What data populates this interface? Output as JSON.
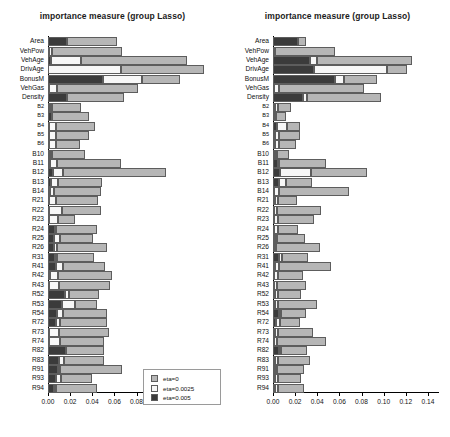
{
  "figure": {
    "width": 450,
    "height": 437,
    "background": "#ffffff"
  },
  "legend": {
    "entries": [
      {
        "label": "eta=0",
        "color": "#b6b6b6",
        "key": "e0"
      },
      {
        "label": "eta=0.0025",
        "color": "#f7f7f7",
        "key": "e1"
      },
      {
        "label": "eta=0.005",
        "color": "#3b3b3b",
        "key": "e2"
      }
    ]
  },
  "axis": {
    "ticks": [
      0,
      0.02,
      0.04,
      0.06,
      0.08,
      0.1,
      0.12,
      0.14
    ],
    "tick_labels": [
      "0.00",
      "0.02",
      "0.04",
      "0.06",
      "0.08",
      "0.10",
      "0.12",
      "0.14"
    ],
    "xlim": [
      0,
      0.15
    ]
  },
  "categories": [
    "Area",
    "VehPow",
    "VehAge",
    "DrivAge",
    "BonusM",
    "VehGas",
    "Density",
    "B2",
    "B3",
    "B4",
    "B5",
    "B6",
    "B10",
    "B11",
    "B12",
    "B13",
    "B14",
    "R21",
    "R22",
    "R23",
    "R24",
    "R25",
    "R26",
    "R31",
    "R41",
    "R42",
    "R43",
    "R52",
    "R53",
    "R54",
    "R72",
    "R73",
    "R74",
    "R82",
    "R83",
    "R91",
    "R93",
    "R94"
  ],
  "small_labels": [
    "B2",
    "B3",
    "B4",
    "B5",
    "B6"
  ],
  "chart_data": [
    {
      "type": "bar",
      "orientation": "horizontal",
      "stacked": true,
      "panel": "left",
      "title": "importance measure (group Lasso)",
      "xlabel": "",
      "ylabel": "",
      "xlim": [
        0,
        0.15
      ],
      "grid": false,
      "legend_position": "bottom-right",
      "categories": [
        "Area",
        "VehPow",
        "VehAge",
        "DrivAge",
        "BonusM",
        "VehGas",
        "Density",
        "B2",
        "B3",
        "B4",
        "B5",
        "B6",
        "B10",
        "B11",
        "B12",
        "B13",
        "B14",
        "R21",
        "R22",
        "R23",
        "R24",
        "R25",
        "R26",
        "R31",
        "R41",
        "R42",
        "R43",
        "R52",
        "R53",
        "R54",
        "R72",
        "R73",
        "R74",
        "R82",
        "R83",
        "R91",
        "R93",
        "R94"
      ],
      "series": [
        {
          "name": "eta=0.005",
          "color": "#3b3b3b",
          "values": [
            0.0175,
            0.0012,
            0.003,
            0.0,
            0.05,
            0.001,
            0.017,
            0.0016,
            0.0035,
            0.0012,
            0.001,
            0.0009,
            0.0018,
            0.0014,
            0.0042,
            0.003,
            0.0015,
            0.001,
            0.0008,
            0.0008,
            0.006,
            0.0058,
            0.0055,
            0.006,
            0.0072,
            0.0014,
            0.0012,
            0.015,
            0.013,
            0.0085,
            0.007,
            0.0012,
            0.001,
            0.016,
            0.0095,
            0.009,
            0.007,
            0.0055
          ]
        },
        {
          "name": "eta=0.0025",
          "color": "#f7f7f7",
          "values": [
            0.0,
            0.002,
            0.027,
            0.066,
            0.035,
            0.007,
            0.0,
            0.0018,
            0.0,
            0.006,
            0.006,
            0.006,
            0.0015,
            0.0065,
            0.009,
            0.006,
            0.0035,
            0.0062,
            0.012,
            0.008,
            0.0002,
            0.005,
            0.003,
            0.002,
            0.006,
            0.0075,
            0.0085,
            0.004,
            0.011,
            0.005,
            0.004,
            0.009,
            0.0095,
            0.0,
            0.005,
            0.002,
            0.005,
            0.002
          ]
        },
        {
          "name": "eta=0",
          "color": "#b6b6b6",
          "values": [
            0.045,
            0.064,
            0.096,
            0.075,
            0.034,
            0.073,
            0.052,
            0.026,
            0.034,
            0.035,
            0.03,
            0.022,
            0.03,
            0.058,
            0.093,
            0.04,
            0.043,
            0.038,
            0.035,
            0.016,
            0.038,
            0.03,
            0.045,
            0.034,
            0.038,
            0.049,
            0.046,
            0.027,
            0.02,
            0.04,
            0.042,
            0.045,
            0.04,
            0.035,
            0.036,
            0.056,
            0.028,
            0.037
          ]
        }
      ]
    },
    {
      "type": "bar",
      "orientation": "horizontal",
      "stacked": true,
      "panel": "right",
      "title": "importance measure (group Lasso)",
      "xlabel": "",
      "ylabel": "",
      "xlim": [
        0,
        0.15
      ],
      "grid": false,
      "legend_position": "bottom-right",
      "categories": [
        "Area",
        "VehPow",
        "VehAge",
        "DrivAge",
        "BonusM",
        "VehGas",
        "Density",
        "B2",
        "B3",
        "B4",
        "B5",
        "B6",
        "B10",
        "B11",
        "B12",
        "B13",
        "B14",
        "R21",
        "R22",
        "R23",
        "R24",
        "R25",
        "R26",
        "R31",
        "R41",
        "R42",
        "R43",
        "R52",
        "R53",
        "R54",
        "R72",
        "R73",
        "R74",
        "R82",
        "R83",
        "R91",
        "R93",
        "R94"
      ],
      "series": [
        {
          "name": "eta=0.005",
          "color": "#3b3b3b",
          "values": [
            0.023,
            0.002,
            0.033,
            0.037,
            0.056,
            0.0012,
            0.027,
            0.0016,
            0.0014,
            0.004,
            0.0016,
            0.0014,
            0.002,
            0.0048,
            0.0065,
            0.0055,
            0.0012,
            0.0016,
            0.001,
            0.0012,
            0.0012,
            0.0018,
            0.0015,
            0.0055,
            0.002,
            0.001,
            0.0012,
            0.0014,
            0.0016,
            0.005,
            0.0026,
            0.0014,
            0.0012,
            0.005,
            0.002,
            0.0016,
            0.0014,
            0.0016
          ]
        },
        {
          "name": "eta=0.0025",
          "color": "#f7f7f7",
          "values": [
            0.0,
            0.0,
            0.007,
            0.066,
            0.008,
            0.004,
            0.0035,
            0.003,
            0.0016,
            0.009,
            0.0035,
            0.0042,
            0.0016,
            0.001,
            0.028,
            0.006,
            0.0045,
            0.003,
            0.003,
            0.003,
            0.003,
            0.0014,
            0.0014,
            0.003,
            0.0035,
            0.0035,
            0.002,
            0.0035,
            0.0025,
            0.0018,
            0.0035,
            0.0035,
            0.002,
            0.0024,
            0.0028,
            0.0022,
            0.003,
            0.003
          ]
        },
        {
          "name": "eta=0",
          "color": "#b6b6b6",
          "values": [
            0.007,
            0.054,
            0.086,
            0.018,
            0.03,
            0.077,
            0.067,
            0.012,
            0.009,
            0.011,
            0.019,
            0.015,
            0.011,
            0.042,
            0.05,
            0.024,
            0.063,
            0.017,
            0.039,
            0.033,
            0.018,
            0.026,
            0.04,
            0.023,
            0.047,
            0.023,
            0.027,
            0.02,
            0.036,
            0.023,
            0.018,
            0.031,
            0.045,
            0.023,
            0.029,
            0.024,
            0.021,
            0.023
          ]
        }
      ]
    }
  ]
}
